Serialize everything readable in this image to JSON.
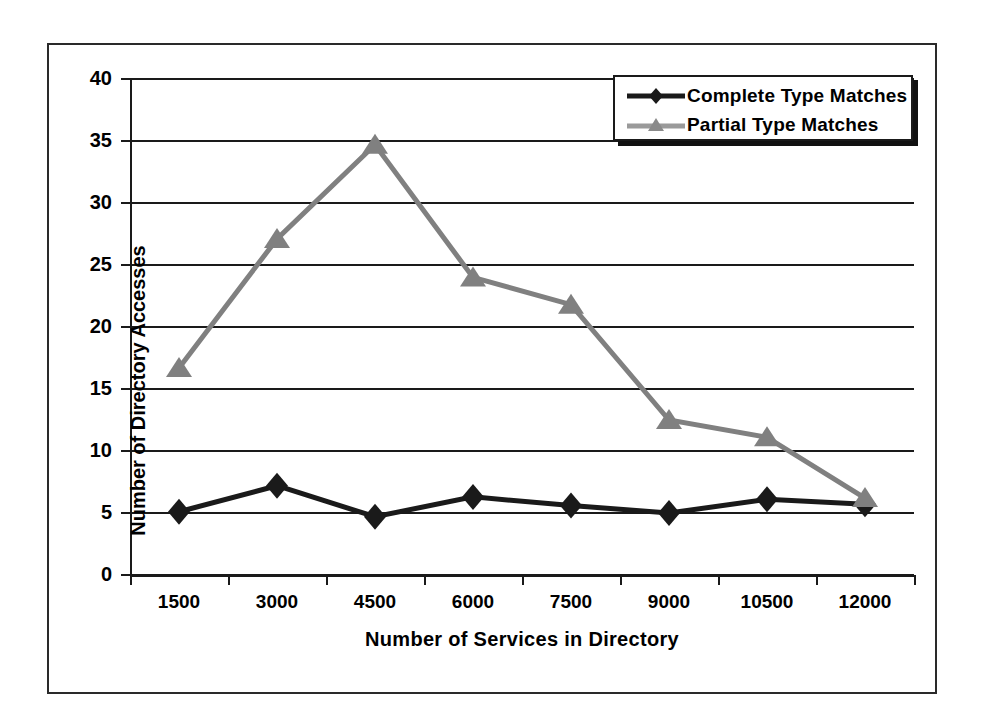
{
  "chart_data": {
    "type": "line",
    "title": "",
    "xlabel": "Number of Services in Directory",
    "ylabel": "Number of Directory Accesses",
    "categories": [
      "1500",
      "3000",
      "4500",
      "6000",
      "7500",
      "9000",
      "10500",
      "12000"
    ],
    "x_tick_labels": [
      "1500",
      "3000",
      "4500",
      "6000",
      "7500",
      "9000",
      "10500",
      "12000"
    ],
    "y_tick_labels": [
      "0",
      "5",
      "10",
      "15",
      "20",
      "25",
      "30",
      "35",
      "40"
    ],
    "y_ticks": [
      0,
      5,
      10,
      15,
      20,
      25,
      30,
      35,
      40
    ],
    "ylim": [
      0,
      40
    ],
    "grid": true,
    "grid_axis": "y",
    "legend_position": "top-right",
    "series": [
      {
        "name": "Complete Type Matches",
        "color": "#1a1a1a",
        "marker": "diamond",
        "values": [
          5.1,
          7.2,
          4.7,
          6.3,
          5.6,
          5.0,
          6.1,
          5.7
        ]
      },
      {
        "name": "Partial Type Matches",
        "color": "#808080",
        "marker": "triangle",
        "values": [
          16.7,
          27.1,
          34.7,
          24.0,
          21.8,
          12.5,
          11.1,
          6.2
        ]
      }
    ]
  },
  "legend": {
    "items": [
      {
        "label": "Complete Type Matches"
      },
      {
        "label": "Partial Type Matches"
      }
    ]
  }
}
